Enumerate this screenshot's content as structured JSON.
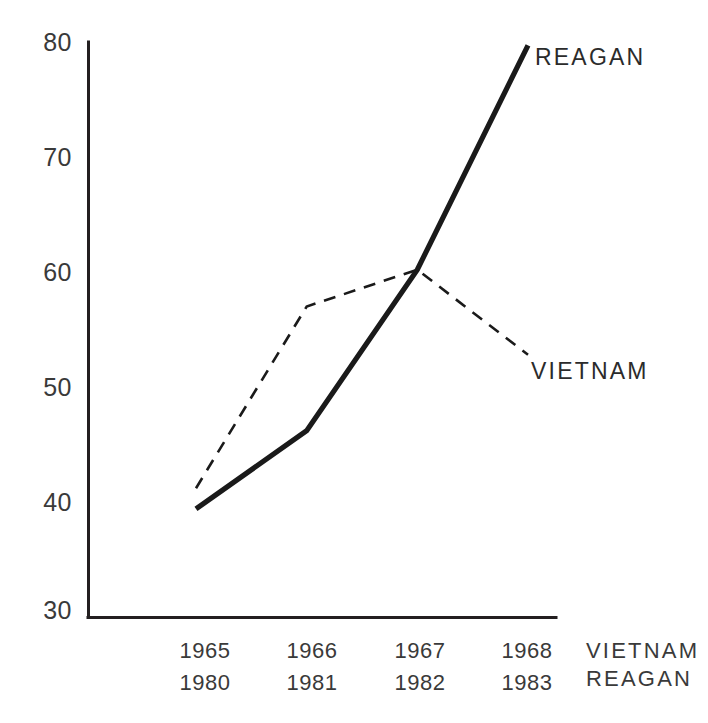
{
  "chart_data": {
    "type": "line",
    "title": "",
    "xlabel": "",
    "ylabel": "",
    "ylim": [
      30,
      80
    ],
    "yticks": [
      80,
      70,
      60,
      50,
      40,
      30
    ],
    "grid": false,
    "legend_position": "inline-right",
    "x_axis_rows": [
      {
        "label": "VIETNAM",
        "categories": [
          "1965",
          "1966",
          "1967",
          "1968"
        ]
      },
      {
        "label": "REAGAN",
        "categories": [
          "1980",
          "1981",
          "1982",
          "1983"
        ]
      }
    ],
    "series": [
      {
        "name": "REAGAN",
        "style": "solid",
        "color": "#1a1a1a",
        "x": [
          "1980",
          "1981",
          "1982",
          "1983"
        ],
        "values": [
          39.4,
          46.2,
          60.2,
          79.7
        ]
      },
      {
        "name": "VIETNAM",
        "style": "dashed",
        "color": "#1a1a1a",
        "x": [
          "1965",
          "1966",
          "1967",
          "1968"
        ],
        "values": [
          41.2,
          57.0,
          60.2,
          52.8
        ]
      }
    ],
    "annotations": [
      {
        "text": "REAGAN",
        "series": "REAGAN",
        "near": "1983"
      },
      {
        "text": "VIETNAM",
        "series": "VIETNAM",
        "near": "1968"
      }
    ]
  },
  "ytick_labels": [
    "80",
    "70",
    "60",
    "50",
    "40",
    "30"
  ],
  "xtick_labels_row1": [
    "1965",
    "1966",
    "1967",
    "1968"
  ],
  "xtick_labels_row2": [
    "1980",
    "1981",
    "1982",
    "1983"
  ],
  "row_legend": {
    "row1": "VIETNAM",
    "row2": "REAGAN"
  },
  "series_labels": {
    "reagan": "REAGAN",
    "vietnam": "VIETNAM"
  },
  "colors": {
    "ink": "#231f20",
    "line": "#1a1a1a",
    "background": "#ffffff"
  }
}
